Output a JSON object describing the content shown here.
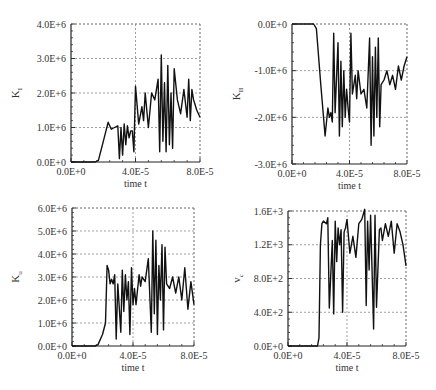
{
  "chart_data": [
    {
      "type": "line",
      "id": "KI",
      "ylabel": "K",
      "ylabel_sub": "I",
      "xlabel": "time t",
      "xlim": [
        0,
        8e-05
      ],
      "ylim": [
        0,
        4000000
      ],
      "xticks": [
        "0.0E+0",
        "4.0E-5",
        "8.0E-5"
      ],
      "yticks": [
        "0.0E+0",
        "1.0E+6",
        "2.0E+6",
        "3.0E+6",
        "4.0E+6"
      ],
      "grid": true,
      "x": [
        0,
        1.5e-05,
        1.7e-05,
        2e-05,
        2.3e-05,
        2.5e-05,
        2.7e-05,
        2.9e-05,
        3e-05,
        3.1e-05,
        3.2e-05,
        3.3e-05,
        3.4e-05,
        3.5e-05,
        3.6e-05,
        3.7e-05,
        3.8e-05,
        3.9e-05,
        4e-05,
        4.2e-05,
        4.4e-05,
        4.5e-05,
        4.6e-05,
        4.8e-05,
        5e-05,
        5.2e-05,
        5.4e-05,
        5.5e-05,
        5.6e-05,
        5.7e-05,
        5.8e-05,
        5.9e-05,
        6e-05,
        6.1e-05,
        6.2e-05,
        6.3e-05,
        6.4e-05,
        6.6e-05,
        6.8e-05,
        7e-05,
        7.2e-05,
        7.3e-05,
        7.4e-05,
        7.5e-05,
        7.6e-05,
        7.8e-05,
        8e-05
      ],
      "values": [
        0,
        0,
        50000,
        600000,
        1150000,
        950000,
        1000000,
        1050000,
        100000,
        1000000,
        200000,
        1100000,
        500000,
        1050000,
        700000,
        900000,
        900000,
        300000,
        2200000,
        1100000,
        1600000,
        1200000,
        2000000,
        1000000,
        2000000,
        1800000,
        2400000,
        300000,
        3100000,
        600000,
        2300000,
        300000,
        2800000,
        500000,
        2000000,
        400000,
        2700000,
        1800000,
        1400000,
        2100000,
        1300000,
        2400000,
        1200000,
        2100000,
        1800000,
        1500000,
        1300000
      ]
    },
    {
      "type": "line",
      "id": "KII",
      "ylabel": "K",
      "ylabel_sub": "II",
      "xlabel": "time t",
      "xlim": [
        0,
        8e-05
      ],
      "ylim": [
        -3000000,
        0
      ],
      "xticks": [
        "0.0E+0",
        "4.0E-5",
        "8.0E-5"
      ],
      "yticks": [
        "-3.0E+6",
        "-2.0E+6",
        "-1.0E+6",
        "0.0E+0"
      ],
      "grid": true,
      "x": [
        0,
        1.5e-05,
        1.7e-05,
        2e-05,
        2.3e-05,
        2.5e-05,
        2.6e-05,
        2.7e-05,
        2.8e-05,
        2.9e-05,
        3e-05,
        3.2e-05,
        3.3e-05,
        3.4e-05,
        3.5e-05,
        3.6e-05,
        3.7e-05,
        3.8e-05,
        3.9e-05,
        4e-05,
        4.1e-05,
        4.2e-05,
        4.4e-05,
        4.5e-05,
        4.6e-05,
        4.8e-05,
        5e-05,
        5.2e-05,
        5.4e-05,
        5.5e-05,
        5.6e-05,
        5.7e-05,
        5.8e-05,
        5.9e-05,
        6e-05,
        6.1e-05,
        6.2e-05,
        6.4e-05,
        6.6e-05,
        6.8e-05,
        7e-05,
        7.2e-05,
        7.4e-05,
        7.6e-05,
        7.8e-05,
        8e-05
      ],
      "values": [
        0,
        0,
        -100000,
        -1300000,
        -2400000,
        -1800000,
        -2000000,
        -1900000,
        -2100000,
        -200000,
        -1900000,
        -400000,
        -2400000,
        -800000,
        -2200000,
        -1000000,
        -2000000,
        -1400000,
        -1800000,
        -2100000,
        -200000,
        -1500000,
        -1100000,
        -1600000,
        -1000000,
        -1500000,
        -1400000,
        -1800000,
        -300000,
        -2600000,
        -700000,
        -2400000,
        -500000,
        -2000000,
        -300000,
        -2200000,
        -1300000,
        -1200000,
        -1000000,
        -1300000,
        -1100000,
        -1400000,
        -900000,
        -1200000,
        -900000,
        -700000
      ]
    },
    {
      "type": "line",
      "id": "Ku",
      "ylabel": "K",
      "ylabel_sub": "u",
      "xlabel": "time t",
      "xlim": [
        0,
        8e-05
      ],
      "ylim": [
        0,
        6000000
      ],
      "xticks": [
        "0.0E+0",
        "4.0E-5",
        "8.0E-5"
      ],
      "yticks": [
        "0.0E+0",
        "1.0E+6",
        "2.0E+6",
        "3.0E+6",
        "4.0E+6",
        "5.0E+6",
        "6.0E+6"
      ],
      "grid": true,
      "x": [
        0,
        1.5e-05,
        1.7e-05,
        2e-05,
        2.2e-05,
        2.3e-05,
        2.4e-05,
        2.5e-05,
        2.6e-05,
        2.7e-05,
        2.8e-05,
        2.9e-05,
        3e-05,
        3.2e-05,
        3.3e-05,
        3.4e-05,
        3.5e-05,
        3.6e-05,
        3.7e-05,
        3.8e-05,
        3.9e-05,
        4e-05,
        4.1e-05,
        4.2e-05,
        4.4e-05,
        4.5e-05,
        4.6e-05,
        4.8e-05,
        5e-05,
        5.2e-05,
        5.3e-05,
        5.4e-05,
        5.5e-05,
        5.6e-05,
        5.7e-05,
        5.8e-05,
        5.9e-05,
        6e-05,
        6.1e-05,
        6.2e-05,
        6.4e-05,
        6.6e-05,
        6.8e-05,
        7e-05,
        7.2e-05,
        7.4e-05,
        7.6e-05,
        7.8e-05,
        8e-05
      ],
      "values": [
        0,
        0,
        50000,
        500000,
        1000000,
        3500000,
        3300000,
        2700000,
        2900000,
        2700000,
        3100000,
        300000,
        2700000,
        600000,
        3300000,
        1500000,
        3100000,
        2000000,
        2800000,
        500000,
        3400000,
        1800000,
        2500000,
        1800000,
        3100000,
        2600000,
        3000000,
        2800000,
        3800000,
        600000,
        5000000,
        1400000,
        4600000,
        500000,
        3500000,
        2000000,
        4400000,
        700000,
        4300000,
        2700000,
        2500000,
        3000000,
        2300000,
        3000000,
        2000000,
        3400000,
        1600000,
        2800000,
        1800000
      ]
    },
    {
      "type": "line",
      "id": "vc",
      "ylabel": "v",
      "ylabel_sub": "c",
      "xlabel": "time t",
      "xlim": [
        0,
        8e-05
      ],
      "ylim": [
        0,
        1600
      ],
      "xticks": [
        "0.0E+0",
        "4.0E-5",
        "8.0E-5"
      ],
      "yticks": [
        "0.0E+0",
        "4.0E+2",
        "8.0E+2",
        "1.2E+3",
        "1.6E+3"
      ],
      "grid": true,
      "x": [
        0,
        2e-05,
        2.1e-05,
        2.2e-05,
        2.3e-05,
        2.4e-05,
        2.6e-05,
        2.7e-05,
        2.8e-05,
        3e-05,
        3.1e-05,
        3.2e-05,
        3.3e-05,
        3.4e-05,
        3.5e-05,
        3.6e-05,
        3.7e-05,
        3.8e-05,
        3.9e-05,
        4e-05,
        4.2e-05,
        4.4e-05,
        4.6e-05,
        4.8e-05,
        5e-05,
        5.2e-05,
        5.3e-05,
        5.4e-05,
        5.5e-05,
        5.6e-05,
        5.8e-05,
        5.9e-05,
        6e-05,
        6.2e-05,
        6.3e-05,
        6.4e-05,
        6.6e-05,
        6.8e-05,
        7e-05,
        7.2e-05,
        7.4e-05,
        7.6e-05,
        7.8e-05,
        8e-05
      ],
      "values": [
        0,
        0,
        100,
        1200,
        1450,
        1480,
        1450,
        1520,
        450,
        1250,
        380,
        1480,
        1000,
        1400,
        1200,
        1380,
        400,
        1350,
        1400,
        1500,
        1100,
        1300,
        1050,
        1450,
        1500,
        1620,
        480,
        1480,
        900,
        1550,
        200,
        1550,
        460,
        1380,
        1400,
        1250,
        1450,
        1300,
        1480,
        1100,
        1450,
        1350,
        1200,
        950
      ]
    }
  ]
}
